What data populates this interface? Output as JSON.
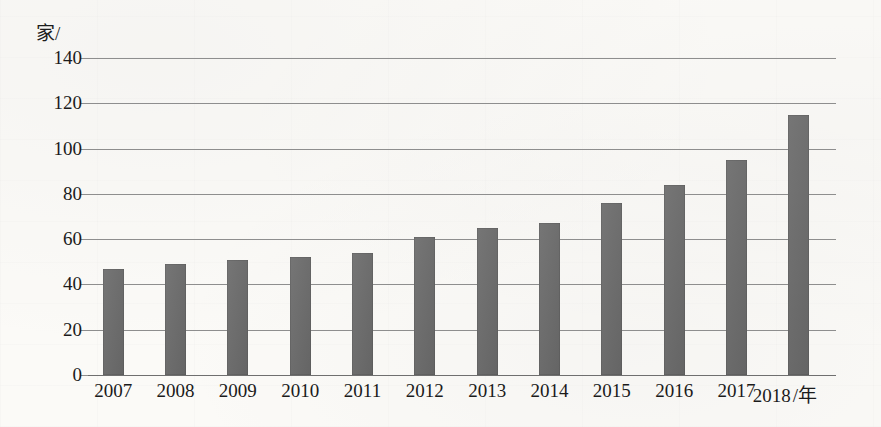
{
  "chart_data": {
    "type": "bar",
    "title": "",
    "subtitle": "",
    "xlabel": "/年",
    "ylabel": "家/",
    "categories": [
      "2007",
      "2008",
      "2009",
      "2010",
      "2011",
      "2012",
      "2013",
      "2014",
      "2015",
      "2016",
      "2017",
      "2018"
    ],
    "values": [
      47,
      49,
      51,
      52,
      54,
      61,
      65,
      67,
      76,
      84,
      95,
      115
    ],
    "series": [
      {
        "name": "数量",
        "values": [
          47,
          49,
          51,
          52,
          54,
          61,
          65,
          67,
          76,
          84,
          95,
          115
        ]
      }
    ],
    "ylim": [
      0,
      140
    ],
    "yticks": [
      0,
      20,
      40,
      60,
      80,
      100,
      120,
      140
    ],
    "ytick_labels": [
      "0",
      "20",
      "40",
      "60",
      "80",
      "100",
      "120",
      "140"
    ],
    "grid": true,
    "legend": "none",
    "bar_color": "#6b6b6b",
    "gridline_color": "#8e8e8e",
    "axis_text_color": "#1b1b1b",
    "background_color": "#fbfaf7",
    "y_unit_label": "家/",
    "x_unit_label": "/年"
  }
}
